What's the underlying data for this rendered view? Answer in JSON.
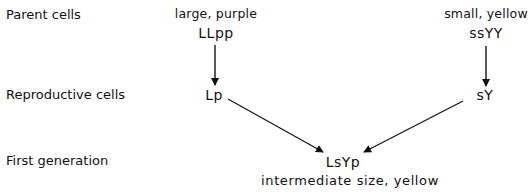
{
  "rows": {
    "parent": "Parent cells",
    "reproductive": "Reproductive cells",
    "first_generation": "First generation"
  },
  "parents": {
    "left": {
      "phenotype": "large, purple",
      "genotype": "LLpp"
    },
    "right": {
      "phenotype": "small, yellow",
      "genotype": "ssYY"
    }
  },
  "gametes": {
    "left": "Lp",
    "right": "sY"
  },
  "offspring": {
    "genotype": "LsYp",
    "phenotype": "intermediate size, yellow"
  },
  "colors": {
    "ink": "#111111",
    "background": "#ffffff"
  }
}
